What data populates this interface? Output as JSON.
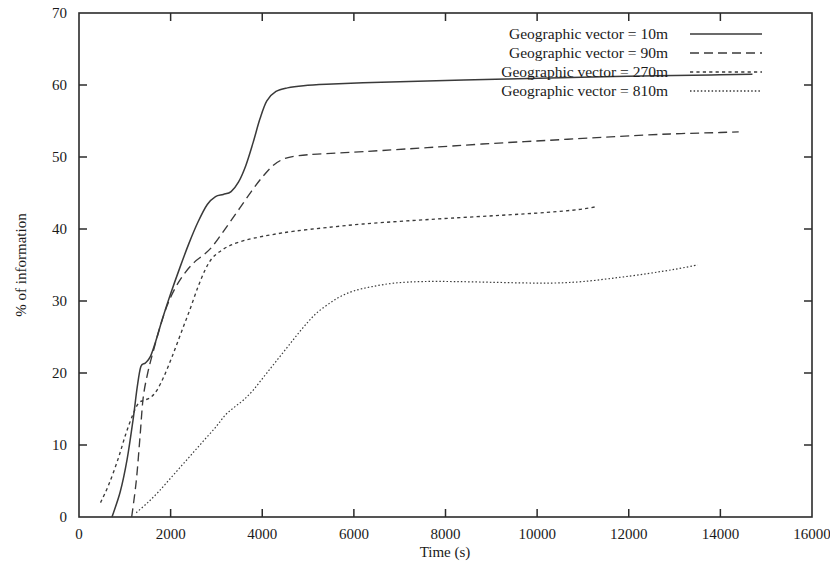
{
  "chart_data": {
    "type": "line",
    "title": "",
    "xlabel": "Time (s)",
    "ylabel": "% of information",
    "xlim": [
      0,
      16000
    ],
    "ylim": [
      0,
      70
    ],
    "xticks": [
      0,
      2000,
      4000,
      6000,
      8000,
      10000,
      12000,
      14000,
      16000
    ],
    "yticks": [
      0,
      10,
      20,
      30,
      40,
      50,
      60,
      70
    ],
    "xtick_labels": [
      "0",
      "2000",
      "4000",
      "6000",
      "8000",
      "10000",
      "12000",
      "14000",
      "16000"
    ],
    "ytick_labels": [
      "0",
      "10",
      "20",
      "30",
      "40",
      "50",
      "60",
      "70"
    ],
    "grid": false,
    "legend_position": "top-right",
    "series": [
      {
        "name": "Geographic vector = 10m",
        "style": "solid",
        "points": [
          [
            720,
            0.0
          ],
          [
            900,
            3.5
          ],
          [
            1050,
            8.0
          ],
          [
            1180,
            13.5
          ],
          [
            1270,
            18.0
          ],
          [
            1350,
            20.9
          ],
          [
            1450,
            21.4
          ],
          [
            1560,
            22.3
          ],
          [
            1680,
            24.5
          ],
          [
            1820,
            27.5
          ],
          [
            2000,
            31.0
          ],
          [
            2200,
            34.6
          ],
          [
            2400,
            38.0
          ],
          [
            2600,
            41.0
          ],
          [
            2800,
            43.4
          ],
          [
            2980,
            44.5
          ],
          [
            3150,
            44.8
          ],
          [
            3320,
            45.2
          ],
          [
            3480,
            46.5
          ],
          [
            3640,
            48.8
          ],
          [
            3800,
            52.0
          ],
          [
            3950,
            55.3
          ],
          [
            4100,
            57.8
          ],
          [
            4300,
            59.1
          ],
          [
            4550,
            59.6
          ],
          [
            4900,
            59.9
          ],
          [
            5400,
            60.1
          ],
          [
            6200,
            60.3
          ],
          [
            7200,
            60.5
          ],
          [
            8400,
            60.7
          ],
          [
            9800,
            60.9
          ],
          [
            11200,
            61.1
          ],
          [
            12600,
            61.3
          ],
          [
            13800,
            61.4
          ],
          [
            14700,
            61.5
          ]
        ]
      },
      {
        "name": "Geographic vector = 90m",
        "style": "dashed",
        "points": [
          [
            1150,
            0.0
          ],
          [
            1250,
            5.0
          ],
          [
            1330,
            11.0
          ],
          [
            1400,
            16.5
          ],
          [
            1500,
            20.0
          ],
          [
            1620,
            23.0
          ],
          [
            1760,
            26.2
          ],
          [
            1920,
            29.3
          ],
          [
            2100,
            31.8
          ],
          [
            2300,
            33.8
          ],
          [
            2520,
            35.4
          ],
          [
            2720,
            36.4
          ],
          [
            2900,
            37.5
          ],
          [
            3100,
            39.2
          ],
          [
            3300,
            41.0
          ],
          [
            3520,
            43.0
          ],
          [
            3760,
            45.2
          ],
          [
            4000,
            47.2
          ],
          [
            4250,
            48.9
          ],
          [
            4500,
            49.8
          ],
          [
            4800,
            50.2
          ],
          [
            5200,
            50.4
          ],
          [
            5800,
            50.6
          ],
          [
            6600,
            50.9
          ],
          [
            7600,
            51.3
          ],
          [
            8800,
            51.8
          ],
          [
            10200,
            52.3
          ],
          [
            11600,
            52.8
          ],
          [
            12900,
            53.2
          ],
          [
            14000,
            53.4
          ],
          [
            14400,
            53.5
          ]
        ]
      },
      {
        "name": "Geographic vector = 270m",
        "style": "dotted",
        "points": [
          [
            470,
            2.0
          ],
          [
            650,
            4.5
          ],
          [
            850,
            8.0
          ],
          [
            1020,
            11.5
          ],
          [
            1180,
            14.3
          ],
          [
            1300,
            15.8
          ],
          [
            1420,
            16.2
          ],
          [
            1560,
            16.6
          ],
          [
            1700,
            17.6
          ],
          [
            1860,
            19.6
          ],
          [
            2040,
            22.4
          ],
          [
            2230,
            25.6
          ],
          [
            2420,
            28.8
          ],
          [
            2600,
            32.0
          ],
          [
            2760,
            34.4
          ],
          [
            2900,
            35.9
          ],
          [
            3060,
            36.8
          ],
          [
            3260,
            37.6
          ],
          [
            3500,
            38.2
          ],
          [
            3800,
            38.7
          ],
          [
            4200,
            39.2
          ],
          [
            4700,
            39.7
          ],
          [
            5400,
            40.2
          ],
          [
            6200,
            40.7
          ],
          [
            7100,
            41.1
          ],
          [
            8100,
            41.5
          ],
          [
            9200,
            41.9
          ],
          [
            10200,
            42.3
          ],
          [
            10900,
            42.7
          ],
          [
            11300,
            43.1
          ]
        ]
      },
      {
        "name": "Geographic vector = 810m",
        "style": "fine-dotted",
        "points": [
          [
            1250,
            0.6
          ],
          [
            1500,
            2.0
          ],
          [
            1750,
            3.6
          ],
          [
            2000,
            5.4
          ],
          [
            2250,
            7.2
          ],
          [
            2500,
            9.0
          ],
          [
            2750,
            10.8
          ],
          [
            3000,
            12.6
          ],
          [
            3200,
            14.2
          ],
          [
            3400,
            15.3
          ],
          [
            3600,
            16.3
          ],
          [
            3800,
            17.6
          ],
          [
            4000,
            19.2
          ],
          [
            4200,
            20.8
          ],
          [
            4400,
            22.4
          ],
          [
            4600,
            24.0
          ],
          [
            4800,
            25.6
          ],
          [
            5000,
            27.1
          ],
          [
            5200,
            28.4
          ],
          [
            5450,
            29.6
          ],
          [
            5700,
            30.6
          ],
          [
            6000,
            31.4
          ],
          [
            6400,
            32.0
          ],
          [
            6900,
            32.5
          ],
          [
            7500,
            32.7
          ],
          [
            8200,
            32.7
          ],
          [
            9000,
            32.6
          ],
          [
            9800,
            32.5
          ],
          [
            10400,
            32.5
          ],
          [
            11000,
            32.7
          ],
          [
            11700,
            33.2
          ],
          [
            12400,
            33.8
          ],
          [
            13000,
            34.4
          ],
          [
            13500,
            35.0
          ]
        ]
      }
    ]
  },
  "legend": {
    "entries": [
      {
        "label": "Geographic vector = 10m",
        "style": "solid"
      },
      {
        "label": "Geographic vector = 90m",
        "style": "dashed"
      },
      {
        "label": "Geographic vector = 270m",
        "style": "dotted"
      },
      {
        "label": "Geographic vector = 810m",
        "style": "fine-dotted"
      }
    ]
  },
  "colors": {
    "line": "#3a3a3a",
    "axis": "#2b2b2b",
    "text": "#1a1a1a",
    "background": "#ffffff"
  }
}
